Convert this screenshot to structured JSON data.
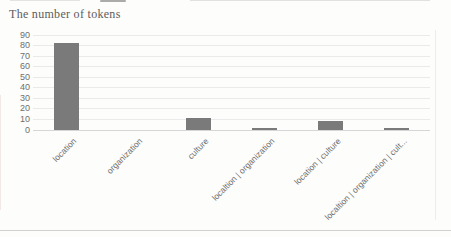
{
  "page": {
    "title": "The number of tokens"
  },
  "chart_data": {
    "type": "bar",
    "title": "The number of tokens",
    "categories": [
      "location",
      "organization",
      "culture",
      "localtion | organization",
      "location | culture",
      "localtion | organization | cult..."
    ],
    "values": [
      82,
      0,
      11,
      2,
      9,
      2
    ],
    "xlabel": "",
    "ylabel": "",
    "ylim": [
      0,
      90
    ],
    "yticks": [
      0,
      10,
      20,
      30,
      40,
      50,
      60,
      70,
      80,
      90
    ],
    "grid": "horizontal",
    "legend": "none",
    "x_label_rotation_deg": 45,
    "colors": {
      "bar": "#7a7a7a",
      "gridline": "#eaeaea",
      "zero_line": "#d6d6d6",
      "tick_label": "#6f6f6f",
      "category_label": "#6e6e6e",
      "title": "#5c5c5c"
    }
  }
}
